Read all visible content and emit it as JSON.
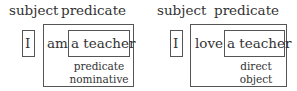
{
  "diagrams": [
    {
      "subject_label": "subject",
      "predicate_label": "predicate",
      "subject_word": "I",
      "verb": "am",
      "complement": "a teacher",
      "complement_role_line1": "predicate",
      "complement_role_line2": "nominative"
    },
    {
      "subject_label": "subject",
      "predicate_label": "predicate",
      "subject_word": "I",
      "verb": "love",
      "complement": "a teacher",
      "complement_role_line1": "direct",
      "complement_role_line2": "object"
    }
  ]
}
